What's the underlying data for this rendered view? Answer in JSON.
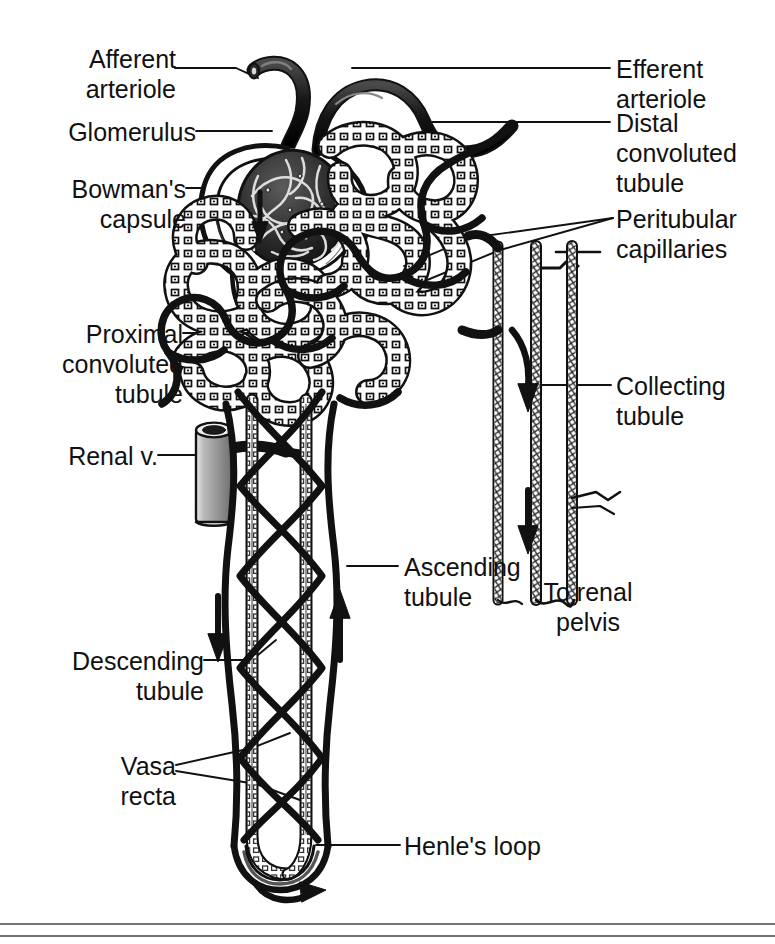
{
  "figure": {
    "kind": "anatomical-line-diagram",
    "style": "black-and-white pen-and-ink textbook illustration",
    "background_color": "#ffffff",
    "ink_color": "#111111"
  },
  "labels": {
    "afferent_arteriole": "Afferent\narteriole",
    "glomerulus": "Glomerulus",
    "bowmans_capsule": "Bowman's\ncapsule",
    "proximal_convoluted_tubule": "Proximal\nconvoluted\ntubule",
    "renal_vein": "Renal v.",
    "descending_tubule": "Descending\ntubule",
    "vasa_recta": "Vasa\nrecta",
    "efferent_arteriole": "Efferent\narteriole",
    "distal_convoluted_tubule": "Distal\nconvoluted\ntubule",
    "peritubular_capillaries": "Peritubular\ncapillaries",
    "collecting_tubule": "Collecting\ntubule",
    "ascending_tubule": "Ascending\ntubule",
    "to_renal_pelvis": "To renal\npelvis",
    "henles_loop": "Henle's loop"
  },
  "flow_arrows": [
    {
      "name": "filtrate-into-bowmans-capsule",
      "direction": "down"
    },
    {
      "name": "descending-limb-flow",
      "direction": "down"
    },
    {
      "name": "ascending-limb-flow",
      "direction": "up"
    },
    {
      "name": "henles-loop-turn",
      "direction": "curved-right"
    },
    {
      "name": "distal-into-collecting-tubule",
      "direction": "curved-down"
    },
    {
      "name": "collecting-tubule-flow",
      "direction": "down"
    }
  ],
  "footer_rules": 2
}
